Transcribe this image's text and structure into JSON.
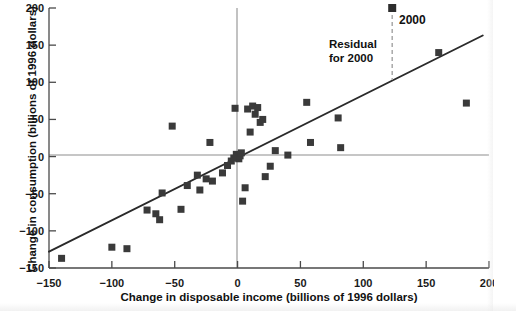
{
  "chart_data": {
    "type": "scatter",
    "title": "",
    "xlabel": "Change in disposable income (billions of 1996 dollars)",
    "ylabel": "Change in consumption (billions of 1996 dollars)",
    "xlim": [
      -150,
      200
    ],
    "ylim": [
      -150,
      200
    ],
    "xticks": [
      -150,
      -100,
      -50,
      0,
      50,
      100,
      150,
      200
    ],
    "yticks": [
      -150,
      -100,
      -50,
      0,
      50,
      100,
      150,
      200
    ],
    "xtick_labels": [
      "−150",
      "−100",
      "−50",
      "0",
      "50",
      "100",
      "150",
      "200"
    ],
    "ytick_labels": [
      "−150",
      "−100",
      "−50",
      "0",
      "50",
      "100",
      "150",
      "200"
    ],
    "grid": false,
    "zero_reference_lines": {
      "horizontal_y": 0,
      "vertical_x": 0,
      "color": "#b0b0b0"
    },
    "marker": {
      "shape": "square",
      "color": "#3a3a3a",
      "size_px": 7
    },
    "points": [
      {
        "x": -140,
        "y": -137
      },
      {
        "x": -100,
        "y": -122
      },
      {
        "x": -88,
        "y": -124
      },
      {
        "x": -72,
        "y": -72
      },
      {
        "x": -65,
        "y": -77
      },
      {
        "x": -62,
        "y": -85
      },
      {
        "x": -60,
        "y": -49
      },
      {
        "x": -52,
        "y": 41
      },
      {
        "x": -45,
        "y": -71
      },
      {
        "x": -40,
        "y": -39
      },
      {
        "x": -32,
        "y": -25
      },
      {
        "x": -30,
        "y": -45
      },
      {
        "x": -25,
        "y": -30
      },
      {
        "x": -22,
        "y": 19
      },
      {
        "x": -20,
        "y": -33
      },
      {
        "x": -12,
        "y": -22
      },
      {
        "x": -8,
        "y": -12
      },
      {
        "x": -5,
        "y": -6
      },
      {
        "x": -3,
        "y": -2
      },
      {
        "x": -2,
        "y": 65
      },
      {
        "x": -1,
        "y": 3
      },
      {
        "x": 1,
        "y": -3
      },
      {
        "x": 2,
        "y": 1
      },
      {
        "x": 3,
        "y": 5
      },
      {
        "x": 4,
        "y": -60
      },
      {
        "x": 6,
        "y": -42
      },
      {
        "x": 8,
        "y": 64
      },
      {
        "x": 10,
        "y": 33
      },
      {
        "x": 12,
        "y": 68
      },
      {
        "x": 14,
        "y": 57
      },
      {
        "x": 16,
        "y": 66
      },
      {
        "x": 18,
        "y": 46
      },
      {
        "x": 20,
        "y": 50
      },
      {
        "x": 22,
        "y": -27
      },
      {
        "x": 26,
        "y": -13
      },
      {
        "x": 30,
        "y": 8
      },
      {
        "x": 40,
        "y": 2
      },
      {
        "x": 55,
        "y": 73
      },
      {
        "x": 58,
        "y": 19
      },
      {
        "x": 80,
        "y": 52
      },
      {
        "x": 82,
        "y": 12
      },
      {
        "x": 160,
        "y": 140
      },
      {
        "x": 182,
        "y": 72
      }
    ],
    "highlighted_point": {
      "label": "2000",
      "x": 123,
      "y": 200
    },
    "regression_line": {
      "x_start": -150,
      "y_start": -128,
      "x_end": 195,
      "y_end": 163,
      "color": "#2a2a2a"
    },
    "residual_annotation": {
      "label_line1": "Residual",
      "label_line2": "for 2000",
      "at_x": 123,
      "from_y": 200,
      "to_y": 103,
      "line_style": "dashed",
      "color": "#a8a8a8"
    },
    "legend": {
      "position": "top-right",
      "entries": [
        {
          "label": "2000",
          "marker": "square",
          "color": "#3a3a3a"
        }
      ]
    }
  },
  "side_column": {
    "italic_lines": [
      "C",
      "a",
      "D",
      "R"
    ],
    "roman_lines": [
      "Th",
      "th"
    ]
  }
}
